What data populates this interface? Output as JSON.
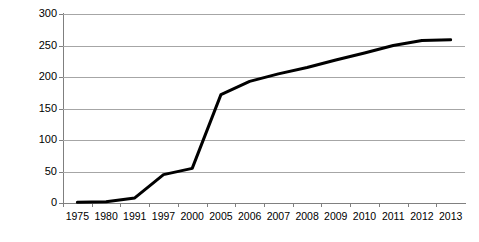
{
  "chart_data": {
    "type": "line",
    "title": "",
    "xlabel": "",
    "ylabel": "Number of FTAs",
    "categories": [
      "1975",
      "1980",
      "1991",
      "1997",
      "2000",
      "2005",
      "2006",
      "2007",
      "2008",
      "2009",
      "2010",
      "2011",
      "2012",
      "2013"
    ],
    "values": [
      1,
      2,
      8,
      45,
      55,
      172,
      193,
      205,
      215,
      227,
      238,
      250,
      258,
      259
    ],
    "series": [
      {
        "name": "Number of FTAs",
        "values": [
          1,
          2,
          8,
          45,
          55,
          172,
          193,
          205,
          215,
          227,
          238,
          250,
          258,
          259
        ]
      }
    ],
    "ylim": [
      0,
      300
    ],
    "yticks": [
      0,
      50,
      100,
      150,
      200,
      250,
      300
    ],
    "ytick_labels": [
      "0",
      "50",
      "100",
      "150",
      "200",
      "250",
      "300"
    ],
    "grid": true,
    "grid_axis": "y",
    "legend": false,
    "line_color": "#000000",
    "grid_color": "#a6a6a6",
    "axis_color": "#7f7f7f",
    "background_color": "#ffffff"
  }
}
